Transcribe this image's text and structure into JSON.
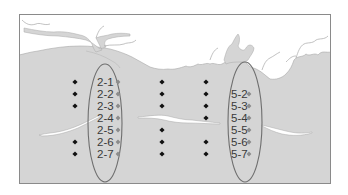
{
  "map": {
    "colors": {
      "water": "#d5d5d5",
      "land": "#ffffff",
      "coast_line": "#a8a8a8",
      "frame": "#8a8a8a",
      "ellipse": "#6e6e6e",
      "black_marker": "#111111",
      "gray_marker": "#8c8c8c",
      "label": "#3a3a3a"
    },
    "rows_y": [
      82,
      94,
      106,
      118,
      130,
      142,
      154
    ],
    "black_marker_columns": [
      {
        "x": 75,
        "rows": [
          0,
          1,
          2,
          5,
          6
        ]
      },
      {
        "x": 162,
        "rows": [
          0,
          1,
          2,
          4,
          5,
          6
        ]
      },
      {
        "x": 206,
        "rows": [
          0,
          1,
          2,
          3,
          5,
          6
        ]
      }
    ],
    "transect_groups": [
      {
        "name": "transect-2",
        "ellipse": {
          "cx": 105,
          "cy": 123,
          "rx": 17,
          "ry": 59
        },
        "stations": [
          {
            "label": "2-1",
            "row": 0
          },
          {
            "label": "2-2",
            "row": 1
          },
          {
            "label": "2-3",
            "row": 2
          },
          {
            "label": "2-4",
            "row": 3
          },
          {
            "label": "2-5",
            "row": 4
          },
          {
            "label": "2-6",
            "row": 5
          },
          {
            "label": "2-7",
            "row": 6
          }
        ],
        "label_x": 97,
        "marker_x": 118
      },
      {
        "name": "transect-5",
        "ellipse": {
          "cx": 245,
          "cy": 122,
          "rx": 17,
          "ry": 60
        },
        "stations": [
          {
            "label": "5-2",
            "row": 1
          },
          {
            "label": "5-3",
            "row": 2
          },
          {
            "label": "5-4",
            "row": 3
          },
          {
            "label": "5-5",
            "row": 4
          },
          {
            "label": "5-6",
            "row": 5
          },
          {
            "label": "5-7",
            "row": 6
          }
        ],
        "label_x": 231,
        "marker_x": 249
      }
    ]
  }
}
